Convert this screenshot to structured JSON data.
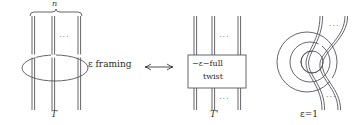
{
  "figure": {
    "background_color": "#ffffff",
    "line_color": "#55555a",
    "text_color": "#2b2b2b"
  },
  "left_panel": {
    "brace_label": "n",
    "strand_dots": "···",
    "bottom_label": "T",
    "strand_count_visible": 3
  },
  "relation": {
    "text": "ε framing",
    "arrow": "⟷"
  },
  "middle_panel": {
    "box_line1": "−ε−full",
    "box_line2": "twist",
    "dots_top": "···",
    "dots_bottom": "···",
    "bottom_label": "T'",
    "strand_count_visible": 3
  },
  "right_panel": {
    "dots_top": "···",
    "dots_bottom": "···",
    "bottom_label": "ε=1",
    "spiral_turns": 3
  }
}
